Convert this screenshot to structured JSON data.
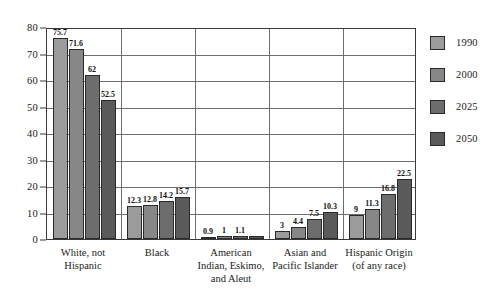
{
  "chart_data": {
    "type": "bar",
    "title": "",
    "xlabel": "",
    "ylabel": "",
    "ylim": [
      0,
      80
    ],
    "yticks": [
      0,
      10,
      20,
      30,
      40,
      50,
      60,
      70,
      80
    ],
    "grid": true,
    "legend_position": "right",
    "categories": [
      "White, not\nHispanic",
      "Black",
      "American\nIndian, Eskimo,\nand Aleut",
      "Asian and\nPacific Islander",
      "Hispanic Origin\n(of any race)"
    ],
    "series": [
      {
        "name": "1990",
        "color": "#9b9b9b",
        "values": [
          75.7,
          12.3,
          0.9,
          3,
          9
        ],
        "labels": [
          "75.7",
          "12.3",
          "0.9",
          "3",
          "9"
        ]
      },
      {
        "name": "2000",
        "color": "#878787",
        "values": [
          71.6,
          12.8,
          1,
          4.4,
          11.3
        ],
        "labels": [
          "71.6",
          "12.8",
          "1",
          "4.4",
          "11.3"
        ]
      },
      {
        "name": "2025",
        "color": "#6d6d6d",
        "values": [
          62,
          14.2,
          1.1,
          7.5,
          16.8
        ],
        "labels": [
          "62",
          "14.2",
          "1.1",
          "7.5",
          "16.8"
        ]
      },
      {
        "name": "2050",
        "color": "#5a5a5a",
        "values": [
          52.5,
          15.7,
          1.2,
          10.3,
          22.5
        ],
        "labels": [
          "52.5",
          "15.7",
          "",
          "10.3",
          "22.5"
        ]
      }
    ]
  }
}
